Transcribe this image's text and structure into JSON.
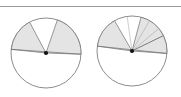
{
  "page": {
    "background_color": "#ffffff",
    "width": 181,
    "height": 97
  },
  "top_rule": {
    "name": "horizontal-divider",
    "color": "#9a9a9a",
    "y": 6,
    "thickness": 1
  },
  "figure": {
    "title": "",
    "caption": "",
    "style": {
      "outline_color": "#6f6f6f",
      "sector_fill": "#e3e3e3",
      "center_dot_color": "#111111",
      "thin_ray_color": "#9c9c9c"
    },
    "diagrams": [
      {
        "id": "left-circle",
        "label": "",
        "center": {
          "x": 46,
          "y": 53
        },
        "radius": 35,
        "center_dot_radius": 2.1,
        "chords": [
          {
            "name": "upper-chord",
            "from_deg": 186,
            "to_deg": 2
          }
        ],
        "sectors": [
          {
            "name": "left-shaded-sector",
            "start_deg": 186,
            "end_deg": 242,
            "fill": "#e3e3e3"
          },
          {
            "name": "lower-right-shaded-sector",
            "start_deg": 289,
            "end_deg": 2,
            "fill": "#e3e3e3"
          }
        ],
        "thin_rays": []
      },
      {
        "id": "right-circle",
        "label": "",
        "center": {
          "x": 132,
          "y": 51
        },
        "radius": 35,
        "center_dot_radius": 2.1,
        "chords": [
          {
            "name": "upper-chord",
            "from_deg": 188,
            "to_deg": 4
          }
        ],
        "sectors": [
          {
            "name": "left-shaded-sector",
            "start_deg": 188,
            "end_deg": 240,
            "fill": "#e3e3e3"
          },
          {
            "name": "lower-right-shaded-sector",
            "start_deg": 285,
            "end_deg": 334,
            "fill": "#e3e3e3"
          },
          {
            "name": "right-shaded-sector",
            "start_deg": 334,
            "end_deg": 4,
            "fill": "#e3e3e3"
          }
        ],
        "thin_rays": [
          {
            "name": "thin-ray-a",
            "angle_deg": 262
          },
          {
            "name": "thin-ray-b",
            "angle_deg": 300
          },
          {
            "name": "thin-ray-c",
            "angle_deg": 320
          }
        ]
      }
    ]
  }
}
